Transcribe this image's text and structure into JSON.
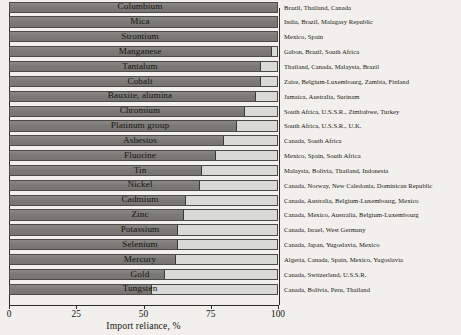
{
  "chart_data": {
    "type": "bar",
    "orientation": "horizontal",
    "title": "",
    "xlabel": "Import reliance, %",
    "ylabel": "",
    "xlim": [
      0,
      100
    ],
    "xticks": [
      0,
      25,
      50,
      75,
      100
    ],
    "xticklabels": [
      "0",
      "25",
      "50",
      "75",
      "100"
    ],
    "grid": false,
    "legend": null,
    "categories": [
      "Columbium",
      "Mica",
      "Strontium",
      "Manganese",
      "Tantalum",
      "Cobalt",
      "Bauxite, alumina",
      "Chromium",
      "Platinum group",
      "Asbestos",
      "Fluorine",
      "Tin",
      "Nickel",
      "Cadmium",
      "Zinc",
      "Potassium",
      "Selenium",
      "Mercury",
      "Gold",
      "Tungsten"
    ],
    "values": [
      100,
      100,
      100,
      98,
      94,
      94,
      92,
      88,
      85,
      80,
      77,
      72,
      71,
      66,
      65,
      63,
      63,
      62,
      58,
      53
    ],
    "annotations": [
      "Brazil, Thailand, Canada",
      "India, Brazil, Malagasy Republic",
      "Mexico, Spain",
      "Gabon, Brazil, South Africa",
      "Thailand, Canada, Malaysia, Brazil",
      "Zaire, Belgium-Luxembourg, Zambia, Finland",
      "Jamaica, Australia, Surinam",
      "South Africa, U.S.S.R., Zimbabwe, Turkey",
      "South Africa, U.S.S.R., U.K.",
      "Canada, South Africa",
      "Mexico, Spain, South Africa",
      "Malaysia, Bolivia, Thailand, Indonesia",
      "Canada, Norway, New Caledonia, Dominican Republic",
      "Canada, Australia, Belgium-Luxembourg, Mexico",
      "Canada, Mexico, Australia, Belgium-Luxembourg",
      "Canada, Israel, West Germany",
      "Canada, Japan, Yugoslavia, Mexico",
      "Algeria, Canada, Spain, Mexico, Yugoslavia",
      "Canada, Switzerland, U.S.S.R.",
      "Canada, Bolivia, Peru, Thailand"
    ],
    "colors": {
      "bar_fill": "#807f7c",
      "bar_track": "#d9d9d5",
      "bar_border": "#4a4a46",
      "axis": "#2b2b28",
      "text": "#16160f",
      "background": "#f1f0ec"
    }
  }
}
